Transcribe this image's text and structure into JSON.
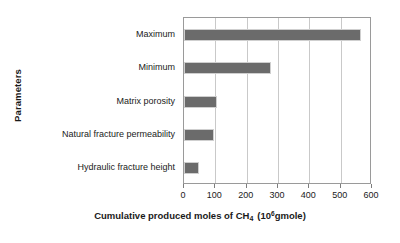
{
  "chart_data": {
    "type": "bar",
    "orientation": "horizontal",
    "title": "",
    "xlabel_parts": {
      "lead": "Cumulative produced moles of CH",
      "sub": "4",
      "open": "(10",
      "sup": "6",
      "tail": "gmole)"
    },
    "xlabel": "Cumulative produced moles of CH4 (10^6 gmole)",
    "ylabel": "Parameters",
    "categories": [
      "Maximum",
      "Minimum",
      "Matrix porosity",
      "Natural fracture permeability",
      "Hydraulic fracture height"
    ],
    "values": [
      565,
      278,
      105,
      95,
      48
    ],
    "xlim": [
      0,
      600
    ],
    "xticks": [
      0,
      100,
      200,
      300,
      400,
      500,
      600
    ],
    "xtick_labels": [
      "0",
      "100",
      "200",
      "300",
      "400",
      "500",
      "600"
    ],
    "grid": "vertical",
    "legend": "none",
    "bar_color": "#6b6b6b",
    "grid_color": "#c9c9c9",
    "axis_color": "#9a9a9a"
  }
}
